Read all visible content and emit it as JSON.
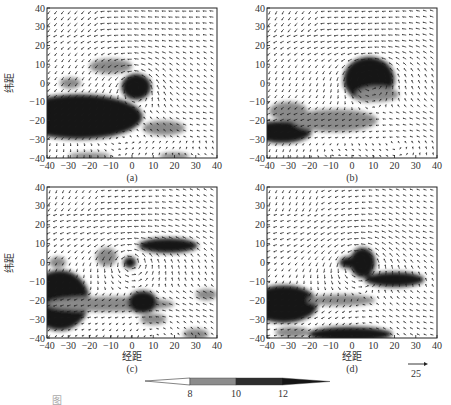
{
  "figure": {
    "ylabel": "纬距",
    "xlabel": "经距",
    "caption_fragment": "图"
  },
  "panels": [
    {
      "id": "a",
      "label": "(a)",
      "box": [
        47,
        8,
        170,
        150
      ],
      "show_xlabel": false,
      "show_ylabel": true
    },
    {
      "id": "b",
      "label": "(b)",
      "box": [
        267,
        8,
        170,
        150
      ],
      "show_xlabel": false,
      "show_ylabel": false
    },
    {
      "id": "c",
      "label": "(c)",
      "box": [
        47,
        187,
        170,
        151
      ],
      "show_xlabel": true,
      "show_ylabel": true
    },
    {
      "id": "d",
      "label": "(d)",
      "box": [
        267,
        187,
        170,
        151
      ],
      "show_xlabel": true,
      "show_ylabel": false
    }
  ],
  "axes": {
    "xticks": [
      -40,
      -30,
      -20,
      -10,
      0,
      10,
      20,
      30,
      40
    ],
    "yticks": [
      40,
      30,
      20,
      10,
      0,
      -10,
      -20,
      -30,
      -40
    ],
    "xlim": [
      -40,
      40
    ],
    "ylim": [
      -40,
      40
    ]
  },
  "colorbar": {
    "ticks": [
      "8",
      "10",
      "12"
    ],
    "levels": [
      {
        "from": "<8",
        "color": "#ffffff"
      },
      {
        "from": "8-10",
        "color": "#8c8c8c"
      },
      {
        "from": "10-12",
        "color": "#2e2e2e"
      },
      {
        "from": ">12",
        "color": "#111111"
      }
    ]
  },
  "reference_vector": {
    "value": "25"
  },
  "chart_data": {
    "type": "heatmap",
    "title": "",
    "xlabel": "经距",
    "ylabel": "纬距",
    "xlim": [
      -40,
      40
    ],
    "ylim": [
      -40,
      40
    ],
    "grid": false,
    "overlay": "wind vector field (quiver), reference arrow 25",
    "colorbar_ticks": [
      8,
      10,
      12
    ],
    "panels": [
      {
        "label": "(a)",
        "shaded_regions": [
          {
            "center": [
              -25,
              -18
            ],
            "size": [
              30,
              12
            ],
            "level": ">12"
          },
          {
            "center": [
              2,
              -2
            ],
            "size": [
              7,
              7
            ],
            "level": ">12"
          },
          {
            "center": [
              -10,
              9
            ],
            "size": [
              10,
              4
            ],
            "level": "8-10"
          },
          {
            "center": [
              -29,
              0
            ],
            "size": [
              5,
              3
            ],
            "level": "8-10"
          },
          {
            "center": [
              15,
              -24
            ],
            "size": [
              10,
              4
            ],
            "level": "8-10"
          },
          {
            "center": [
              -20,
              -39
            ],
            "size": [
              10,
              2
            ],
            "level": "8-10"
          },
          {
            "center": [
              20,
              -39
            ],
            "size": [
              7,
              2
            ],
            "level": "8-10"
          }
        ]
      },
      {
        "label": "(b)",
        "shaded_regions": [
          {
            "center": [
              8,
              2
            ],
            "size": [
              12,
              12
            ],
            "level": ">12"
          },
          {
            "center": [
              12,
              -6
            ],
            "size": [
              10,
              4
            ],
            "level": "8-10"
          },
          {
            "center": [
              -1,
              -1
            ],
            "size": [
              3,
              2
            ],
            "level": ">12"
          },
          {
            "center": [
              -33,
              -26
            ],
            "size": [
              14,
              6
            ],
            "level": ">12"
          },
          {
            "center": [
              -8,
              -20
            ],
            "size": [
              20,
              6
            ],
            "level": "8-10"
          },
          {
            "center": [
              -30,
              -15
            ],
            "size": [
              9,
              5
            ],
            "level": "8-10"
          }
        ]
      },
      {
        "label": "(c)",
        "shaded_regions": [
          {
            "center": [
              -34,
              -20
            ],
            "size": [
              14,
              16
            ],
            "level": ">12"
          },
          {
            "center": [
              -10,
              -22
            ],
            "size": [
              30,
              4
            ],
            "level": "8-10"
          },
          {
            "center": [
              5,
              -21
            ],
            "size": [
              7,
              6
            ],
            "level": ">12"
          },
          {
            "center": [
              17,
              9
            ],
            "size": [
              14,
              4
            ],
            "level": ">12"
          },
          {
            "center": [
              -12,
              3
            ],
            "size": [
              5,
              5
            ],
            "level": "8-10"
          },
          {
            "center": [
              -1,
              0
            ],
            "size": [
              3,
              3
            ],
            "level": ">12"
          },
          {
            "center": [
              -35,
              0
            ],
            "size": [
              4,
              3
            ],
            "level": "8-10"
          },
          {
            "center": [
              10,
              -30
            ],
            "size": [
              6,
              3
            ],
            "level": "8-10"
          },
          {
            "center": [
              35,
              -17
            ],
            "size": [
              5,
              3
            ],
            "level": "8-10"
          },
          {
            "center": [
              30,
              -38
            ],
            "size": [
              6,
              3
            ],
            "level": "8-10"
          }
        ]
      },
      {
        "label": "(d)",
        "shaded_regions": [
          {
            "center": [
              -32,
              -22
            ],
            "size": [
              16,
              10
            ],
            "level": ">12"
          },
          {
            "center": [
              5,
              0
            ],
            "size": [
              6,
              8
            ],
            "level": ">12"
          },
          {
            "center": [
              -2,
              0
            ],
            "size": [
              4,
              3
            ],
            "level": ">12"
          },
          {
            "center": [
              20,
              -9
            ],
            "size": [
              14,
              4
            ],
            "level": ">12"
          },
          {
            "center": [
              -5,
              -20
            ],
            "size": [
              16,
              3
            ],
            "level": "8-10"
          },
          {
            "center": [
              -1,
              -38
            ],
            "size": [
              20,
              4
            ],
            "level": ">12"
          },
          {
            "center": [
              -28,
              -37
            ],
            "size": [
              8,
              3
            ],
            "level": "8-10"
          }
        ]
      }
    ]
  }
}
